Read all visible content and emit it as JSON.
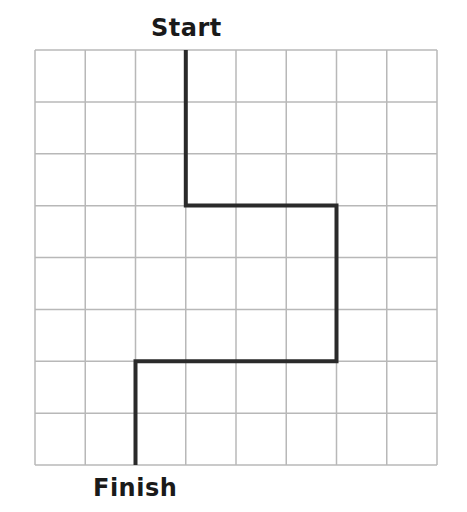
{
  "labels": {
    "start": "Start",
    "finish": "Finish"
  },
  "grid": {
    "columns": 8,
    "rows": 8,
    "left": 35,
    "top": 50,
    "right": 437,
    "bottom": 465,
    "line_color": "#b8b8b8",
    "line_width": 1.5
  },
  "path": {
    "color": "#2a2a2a",
    "width": 4,
    "points_grid": [
      [
        3,
        0
      ],
      [
        3,
        3
      ],
      [
        6,
        3
      ],
      [
        6,
        6
      ],
      [
        2,
        6
      ],
      [
        2,
        8
      ]
    ],
    "moves": [
      "down 3",
      "right 3",
      "down 3",
      "left 4",
      "down 2"
    ]
  }
}
